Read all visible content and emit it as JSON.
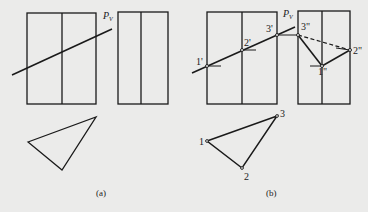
{
  "figure": {
    "panel_a": {
      "caption": "(a)",
      "plane_label": "P",
      "plane_subscript": "V"
    },
    "panel_b": {
      "caption": "(b)",
      "plane_label": "P",
      "plane_subscript": "V",
      "front_view_points": [
        "1'",
        "2'",
        "3'"
      ],
      "side_view_points": [
        "1\"",
        "2\"",
        "3\""
      ],
      "top_view_points": [
        "1",
        "2",
        "3"
      ]
    }
  },
  "style": {
    "line_color": "#1a1a1a",
    "background": "#ebebea"
  }
}
